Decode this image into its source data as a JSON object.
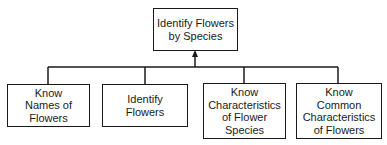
{
  "diagram": {
    "type": "hierarchy",
    "root": {
      "lines": [
        "Identify Flowers",
        "by Species"
      ]
    },
    "children": [
      {
        "lines": [
          "Know",
          "Names of",
          "Flowers"
        ]
      },
      {
        "lines": [
          "Identify",
          "Flowers"
        ]
      },
      {
        "lines": [
          "Know",
          "Characteristics",
          "of Flower",
          "Species"
        ]
      },
      {
        "lines": [
          "Know",
          "Common",
          "Characteristics",
          "of Flowers"
        ]
      }
    ],
    "colors": {
      "line": "#1a1a1a",
      "background": "#ffffff"
    }
  }
}
